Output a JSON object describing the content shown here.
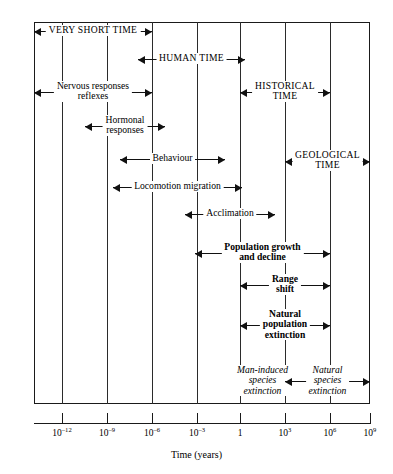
{
  "figure": {
    "axis_title": "Time (years)",
    "geometry": {
      "plot_left": 34,
      "plot_right": 370,
      "plot_top": 22,
      "plot_bottom": 404
    }
  },
  "chart_data": {
    "type": "table",
    "title": "",
    "xlabel": "Time (years)",
    "ylabel": "",
    "axis_scale": "log10",
    "xlim": [
      -13.5,
      9.9
    ],
    "grid": true,
    "legend": "none",
    "tick_labels": [
      "10⁻¹²",
      "10⁻⁹",
      "10⁻⁶",
      "10⁻³",
      "1",
      "10³",
      "10⁶",
      "10⁹"
    ],
    "tick_mantissas": [
      "10",
      "10",
      "10",
      "10",
      "1",
      "10",
      "10",
      "10"
    ],
    "tick_exponents": [
      "-12",
      "-9",
      "-6",
      "-3",
      "",
      "3",
      "6",
      "9"
    ],
    "tick_values": [
      -12,
      -9,
      -6,
      -3,
      0,
      3,
      6,
      9
    ],
    "tick_x_px": [
      62,
      107,
      152,
      197,
      240,
      285,
      330,
      370
    ],
    "gridline_x_px": [
      62,
      107,
      152,
      197,
      240,
      285,
      330
    ],
    "bands": [
      {
        "id": "very-short-time",
        "label": "VERY SHORT TIME",
        "style": "caps",
        "lines": 1,
        "x_start_px": 34,
        "x_end_px": 152,
        "y_px": 31,
        "start_exp": -13.5,
        "end_exp": -6
      },
      {
        "id": "human-time",
        "label": "HUMAN TIME",
        "style": "caps",
        "lines": 1,
        "x_start_px": 138,
        "x_end_px": 245,
        "y_px": 59,
        "start_exp": -7,
        "end_exp": 0.3
      },
      {
        "id": "nervous-responses-reflexes",
        "label": "Nervous responses\nreflexes",
        "label_line1": "Nervous responses",
        "label_line2": "reflexes",
        "style": "normal",
        "lines": 2,
        "x_start_px": 34,
        "x_end_px": 152,
        "y_px": 92,
        "start_exp": -13.5,
        "end_exp": -6
      },
      {
        "id": "historical-time",
        "label": "HISTORICAL\nTIME",
        "label_line1": "HISTORICAL",
        "label_line2": "TIME",
        "style": "caps",
        "lines": 2,
        "x_start_px": 240,
        "x_end_px": 330,
        "y_px": 92,
        "start_exp": 0,
        "end_exp": 6
      },
      {
        "id": "hormonal-responses",
        "label": "Hormonal\nresponses",
        "label_line1": "Hormonal",
        "label_line2": "responses",
        "style": "normal",
        "lines": 2,
        "x_start_px": 85,
        "x_end_px": 165,
        "y_px": 126,
        "start_exp": -10.4,
        "end_exp": -5.1
      },
      {
        "id": "behaviour",
        "label": "Behaviour",
        "style": "normal",
        "lines": 1,
        "x_start_px": 120,
        "x_end_px": 225,
        "y_px": 159,
        "start_exp": -8.1,
        "end_exp": -1.1
      },
      {
        "id": "geological-time",
        "label": "GEOLOGICAL\nTIME",
        "label_line1": "GEOLOGICAL",
        "label_line2": "TIME",
        "style": "caps",
        "lines": 2,
        "x_start_px": 285,
        "x_end_px": 370,
        "y_px": 161,
        "start_exp": 3,
        "end_exp": 9
      },
      {
        "id": "locomotion-migration",
        "label": "Locomotion migration",
        "style": "normal",
        "lines": 1,
        "x_start_px": 113,
        "x_end_px": 242,
        "y_px": 187,
        "start_exp": -8.6,
        "end_exp": 0.1
      },
      {
        "id": "acclimation",
        "label": "Acclimation",
        "style": "normal",
        "lines": 1,
        "x_start_px": 185,
        "x_end_px": 275,
        "y_px": 214,
        "start_exp": -3.8,
        "end_exp": 2.3
      },
      {
        "id": "population-growth-and-decline",
        "label": "Population growth\nand decline",
        "label_line1": "Population growth",
        "label_line2": "and decline",
        "style": "bold",
        "lines": 2,
        "x_start_px": 195,
        "x_end_px": 330,
        "y_px": 253,
        "start_exp": -3.2,
        "end_exp": 6
      },
      {
        "id": "range-shift",
        "label": "Range\nshift",
        "label_line1": "Range",
        "label_line2": "shift",
        "style": "bold",
        "lines": 2,
        "x_start_px": 240,
        "x_end_px": 330,
        "y_px": 285,
        "start_exp": 0,
        "end_exp": 6
      },
      {
        "id": "natural-population-extinction",
        "label": "Natural\npopulation\nextinction",
        "label_line1": "Natural",
        "label_line2": "population",
        "label_line3": "extinction",
        "style": "bold",
        "lines": 3,
        "x_start_px": 240,
        "x_end_px": 330,
        "y_px": 325,
        "start_exp": 0,
        "end_exp": 6
      },
      {
        "id": "man-induced-species-extinction",
        "label": "Man-induced\nspecies\nextinction",
        "label_line1": "Man-induced",
        "label_line2": "species",
        "label_line3": "extinction",
        "style": "italic",
        "lines": 3,
        "x_start_px": 240,
        "x_end_px": 285,
        "y_px": 381,
        "start_exp": 0,
        "end_exp": 3
      },
      {
        "id": "natural-species-extinction",
        "label": "Natural\nspecies\nextinction",
        "label_line1": "Natural",
        "label_line2": "species",
        "label_line3": "extinction",
        "style": "italic",
        "lines": 3,
        "x_start_px": 285,
        "x_end_px": 370,
        "y_px": 381,
        "start_exp": 3,
        "end_exp": 9
      }
    ]
  }
}
